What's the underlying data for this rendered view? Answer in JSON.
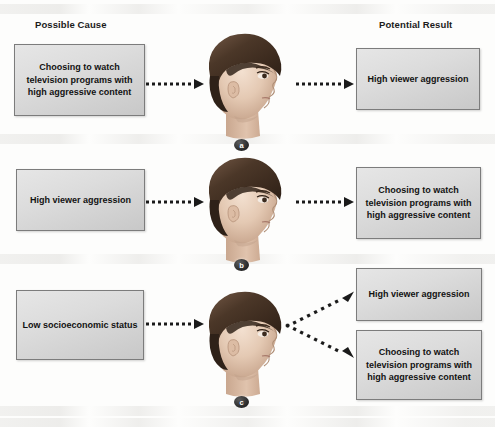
{
  "figure": {
    "headers": {
      "cause": "Possible Cause",
      "result": "Potential Result"
    },
    "labels": {
      "a": "a",
      "b": "b",
      "c": "c"
    },
    "text": {
      "tv_content": "Choosing to watch television programs with high aggressive content",
      "aggression": "High viewer aggression",
      "ses": "Low socioeconomic status"
    },
    "rows": [
      {
        "id": "a",
        "label": "a",
        "cause": "Choosing to watch television programs with high aggressive content",
        "results": [
          "High viewer aggression"
        ],
        "arrows": 2,
        "icon": "child-head-profile"
      },
      {
        "id": "b",
        "label": "b",
        "cause": "High viewer aggression",
        "results": [
          "Choosing to watch television programs with high aggressive content"
        ],
        "arrows": 2,
        "icon": "child-head-profile"
      },
      {
        "id": "c",
        "label": "c",
        "cause": "Low socioeconomic status",
        "results": [
          "High viewer aggression",
          "Choosing to watch television programs with high aggressive content"
        ],
        "arrows": 3,
        "icon": "child-head-profile"
      }
    ],
    "colors": {
      "box_fill_light": "#e6e6e6",
      "box_fill_dark": "#c8c8c8",
      "box_border": "#7c7c7c",
      "text": "#121212",
      "arrow": "#1a1a1a",
      "hair": "#4a3426",
      "skin": "#e6cdb9",
      "background": "#fdfdfc"
    }
  }
}
